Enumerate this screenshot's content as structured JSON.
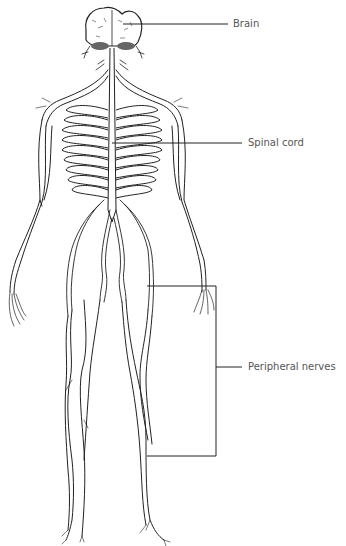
{
  "diagram": {
    "type": "anatomical illustration",
    "labels": [
      {
        "id": "brain",
        "text": "Brain"
      },
      {
        "id": "spinal_cord",
        "text": "Spinal cord"
      },
      {
        "id": "peripheral_nerves",
        "text": "Peripheral nerves"
      }
    ],
    "colors": {
      "line": "#222222",
      "label_text": "#555555",
      "background": "#ffffff"
    }
  }
}
